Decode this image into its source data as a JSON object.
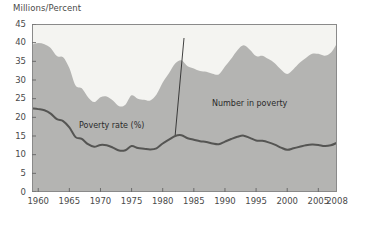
{
  "chart_data": {
    "type": "area",
    "title": "",
    "ylabel": "Millions/Percent",
    "xlabel": "",
    "ylim": [
      0,
      45
    ],
    "xlim": [
      1959,
      2008
    ],
    "ytick_values": [
      0,
      5,
      10,
      15,
      20,
      25,
      30,
      35,
      40,
      45
    ],
    "ytick_labels": [
      "0",
      "5",
      "10",
      "15",
      "20",
      "25",
      "30",
      "35",
      "40",
      "45"
    ],
    "xtick_values": [
      1960,
      1965,
      1970,
      1975,
      1980,
      1985,
      1990,
      1995,
      2000,
      2005,
      2008
    ],
    "xtick_labels": [
      "1960",
      "1965",
      "1970",
      "1975",
      "1980",
      "1985",
      "1990",
      "1995",
      "2000",
      "2005",
      "2008"
    ],
    "grid": false,
    "legend_position": "inline-annotations",
    "colors": {
      "area_fill": "#b4b4b2",
      "area_above": "#f4f4f1",
      "line": "#555553",
      "axis": "#6b6b6b",
      "text": "#4a4a4a",
      "plot_border": "#8a8a8a"
    },
    "x": [
      1959,
      1960,
      1961,
      1962,
      1963,
      1964,
      1965,
      1966,
      1967,
      1968,
      1969,
      1970,
      1971,
      1972,
      1973,
      1974,
      1975,
      1976,
      1977,
      1978,
      1979,
      1980,
      1981,
      1982,
      1983,
      1984,
      1985,
      1986,
      1987,
      1988,
      1989,
      1990,
      1991,
      1992,
      1993,
      1994,
      1995,
      1996,
      1997,
      1998,
      1999,
      2000,
      2001,
      2002,
      2003,
      2004,
      2005,
      2006,
      2007,
      2008
    ],
    "series": [
      {
        "name": "Number in poverty",
        "units": "millions",
        "annotation": "Number in poverty",
        "render": "area",
        "values": [
          39.5,
          39.9,
          39.6,
          38.6,
          36.4,
          36.1,
          33.2,
          28.5,
          27.8,
          25.4,
          24.1,
          25.4,
          25.6,
          24.5,
          23.0,
          23.4,
          25.9,
          25.0,
          24.7,
          24.5,
          26.1,
          29.3,
          31.8,
          34.4,
          35.3,
          33.7,
          33.1,
          32.4,
          32.2,
          31.7,
          31.5,
          33.6,
          35.7,
          38.0,
          39.3,
          38.1,
          36.4,
          36.5,
          35.6,
          34.5,
          32.8,
          31.6,
          32.9,
          34.6,
          35.9,
          37.0,
          37.0,
          36.5,
          37.3,
          39.8
        ]
      },
      {
        "name": "Poverty rate (%)",
        "units": "percent",
        "annotation": "Poverty rate (%)",
        "render": "line",
        "values": [
          22.4,
          22.2,
          21.9,
          21.0,
          19.5,
          19.0,
          17.3,
          14.7,
          14.2,
          12.8,
          12.1,
          12.6,
          12.5,
          11.9,
          11.1,
          11.2,
          12.3,
          11.8,
          11.6,
          11.4,
          11.7,
          13.0,
          14.0,
          15.0,
          15.2,
          14.4,
          14.0,
          13.6,
          13.4,
          13.0,
          12.8,
          13.5,
          14.2,
          14.8,
          15.1,
          14.5,
          13.8,
          13.7,
          13.3,
          12.7,
          11.9,
          11.3,
          11.7,
          12.1,
          12.5,
          12.7,
          12.6,
          12.3,
          12.5,
          13.2
        ]
      }
    ]
  }
}
